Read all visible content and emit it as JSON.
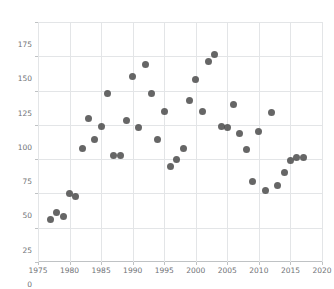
{
  "chart_data": {
    "type": "scatter",
    "title": "",
    "subtitle": "",
    "xlabel": "",
    "ylabel": "",
    "xlim": [
      1975,
      2020
    ],
    "ylim": [
      0,
      175
    ],
    "xticks": [
      1975,
      1980,
      1985,
      1990,
      1995,
      2000,
      2005,
      2010,
      2015,
      2020
    ],
    "yticks": [
      0,
      25,
      50,
      75,
      100,
      125,
      150,
      175
    ],
    "xtick_labels": [
      "1975",
      "1980",
      "1985",
      "1990",
      "1995",
      "2000",
      "2005",
      "2010",
      "2015",
      "2020"
    ],
    "ytick_labels": [
      "0",
      "25",
      "50",
      "75",
      "100",
      "125",
      "150",
      "175"
    ],
    "grid": true,
    "legend": null,
    "marker": {
      "shape": "circle",
      "color": "#4d4d4d",
      "size": 7,
      "opacity": 0.86
    },
    "series": [
      {
        "name": "series-1",
        "x": [
          1977,
          1978,
          1979,
          1980,
          1981,
          1982,
          1983,
          1984,
          1985,
          1986,
          1987,
          1988,
          1989,
          1990,
          1991,
          1992,
          1993,
          1994,
          1995,
          1996,
          1997,
          1998,
          1999,
          2000,
          2001,
          2002,
          2003,
          2004,
          2005,
          2006,
          2007,
          2008,
          2009,
          2010,
          2011,
          2012,
          2013,
          2014,
          2015,
          2016,
          2017
        ],
        "y": [
          31,
          36,
          33,
          50,
          48,
          83,
          105,
          89,
          99,
          123,
          78,
          78,
          103,
          135,
          98,
          144,
          123,
          89,
          110,
          70,
          75,
          83,
          118,
          133,
          110,
          146,
          151,
          99,
          98,
          115,
          94,
          82,
          59,
          95,
          52,
          109,
          56,
          65,
          74,
          76,
          76
        ]
      }
    ],
    "points": [
      {
        "x": 1977,
        "y": 31
      },
      {
        "x": 1978,
        "y": 36
      },
      {
        "x": 1979,
        "y": 33
      },
      {
        "x": 1980,
        "y": 50
      },
      {
        "x": 1981,
        "y": 48
      },
      {
        "x": 1982,
        "y": 83
      },
      {
        "x": 1983,
        "y": 105
      },
      {
        "x": 1984,
        "y": 89
      },
      {
        "x": 1985,
        "y": 99
      },
      {
        "x": 1986,
        "y": 123
      },
      {
        "x": 1987,
        "y": 78
      },
      {
        "x": 1988,
        "y": 78
      },
      {
        "x": 1989,
        "y": 103
      },
      {
        "x": 1990,
        "y": 135
      },
      {
        "x": 1991,
        "y": 98
      },
      {
        "x": 1992,
        "y": 144
      },
      {
        "x": 1993,
        "y": 123
      },
      {
        "x": 1994,
        "y": 89
      },
      {
        "x": 1995,
        "y": 110
      },
      {
        "x": 1996,
        "y": 70
      },
      {
        "x": 1997,
        "y": 75
      },
      {
        "x": 1998,
        "y": 83
      },
      {
        "x": 1999,
        "y": 118
      },
      {
        "x": 2000,
        "y": 133
      },
      {
        "x": 2001,
        "y": 110
      },
      {
        "x": 2002,
        "y": 146
      },
      {
        "x": 2003,
        "y": 151
      },
      {
        "x": 2004,
        "y": 99
      },
      {
        "x": 2005,
        "y": 98
      },
      {
        "x": 2006,
        "y": 115
      },
      {
        "x": 2007,
        "y": 94
      },
      {
        "x": 2008,
        "y": 82
      },
      {
        "x": 2009,
        "y": 59
      },
      {
        "x": 2010,
        "y": 95
      },
      {
        "x": 2011,
        "y": 52
      },
      {
        "x": 2012,
        "y": 109
      },
      {
        "x": 2013,
        "y": 56
      },
      {
        "x": 2014,
        "y": 65
      },
      {
        "x": 2015,
        "y": 74
      },
      {
        "x": 2016,
        "y": 76
      },
      {
        "x": 2017,
        "y": 76
      }
    ]
  },
  "style": {
    "background": "#ffffff",
    "grid_color": "#e3e5e7",
    "axis_color": "#bfc2c4",
    "tick_label_color": "#6f7276"
  }
}
